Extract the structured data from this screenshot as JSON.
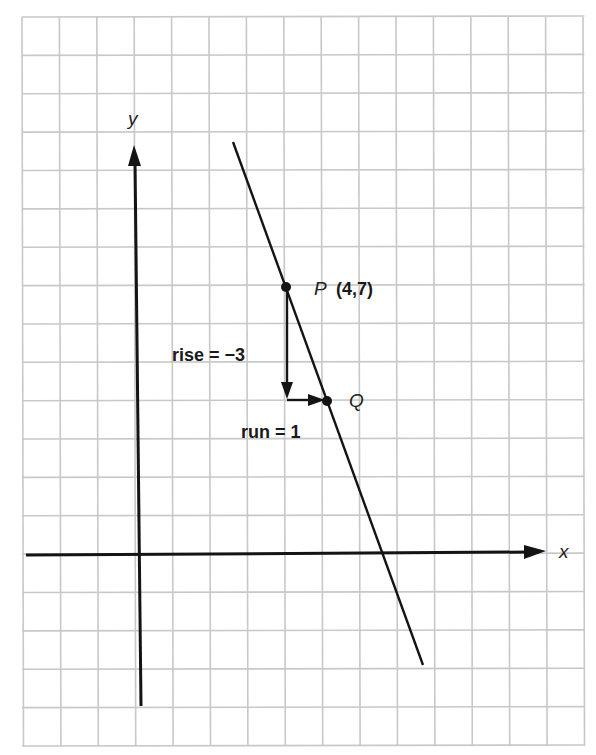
{
  "chart_data": {
    "type": "line",
    "title": "",
    "xlabel": "x",
    "ylabel": "y",
    "grid": true,
    "grid_columns": 15,
    "grid_rows": 19,
    "axis_origin_grid": {
      "col": 3,
      "row": 14
    },
    "series": [
      {
        "name": "line through P and Q",
        "slope": -3,
        "intercept": 19,
        "x": [
          2.5,
          7.5
        ],
        "y": [
          10.5,
          -3
        ]
      }
    ],
    "points": [
      {
        "name": "P",
        "x": 4,
        "y": 7,
        "label": "(4,7)"
      },
      {
        "name": "Q",
        "x": 5,
        "y": 4,
        "label": ""
      }
    ],
    "annotations": [
      {
        "text": "rise = −3",
        "type": "vertical-arrow",
        "from": [
          4,
          7
        ],
        "to": [
          4,
          4
        ]
      },
      {
        "text": "run = 1",
        "type": "horizontal-arrow",
        "from": [
          4,
          4
        ],
        "to": [
          5,
          4
        ]
      }
    ]
  },
  "labels": {
    "x_axis": "x",
    "y_axis": "y",
    "point_p_name": "P",
    "point_p_coords": "(4,7)",
    "point_q_name": "Q",
    "rise": "rise = −3",
    "run": "run = 1"
  },
  "colors": {
    "grid": "#c8c8c8",
    "ink": "#141414",
    "background": "#ffffff"
  }
}
